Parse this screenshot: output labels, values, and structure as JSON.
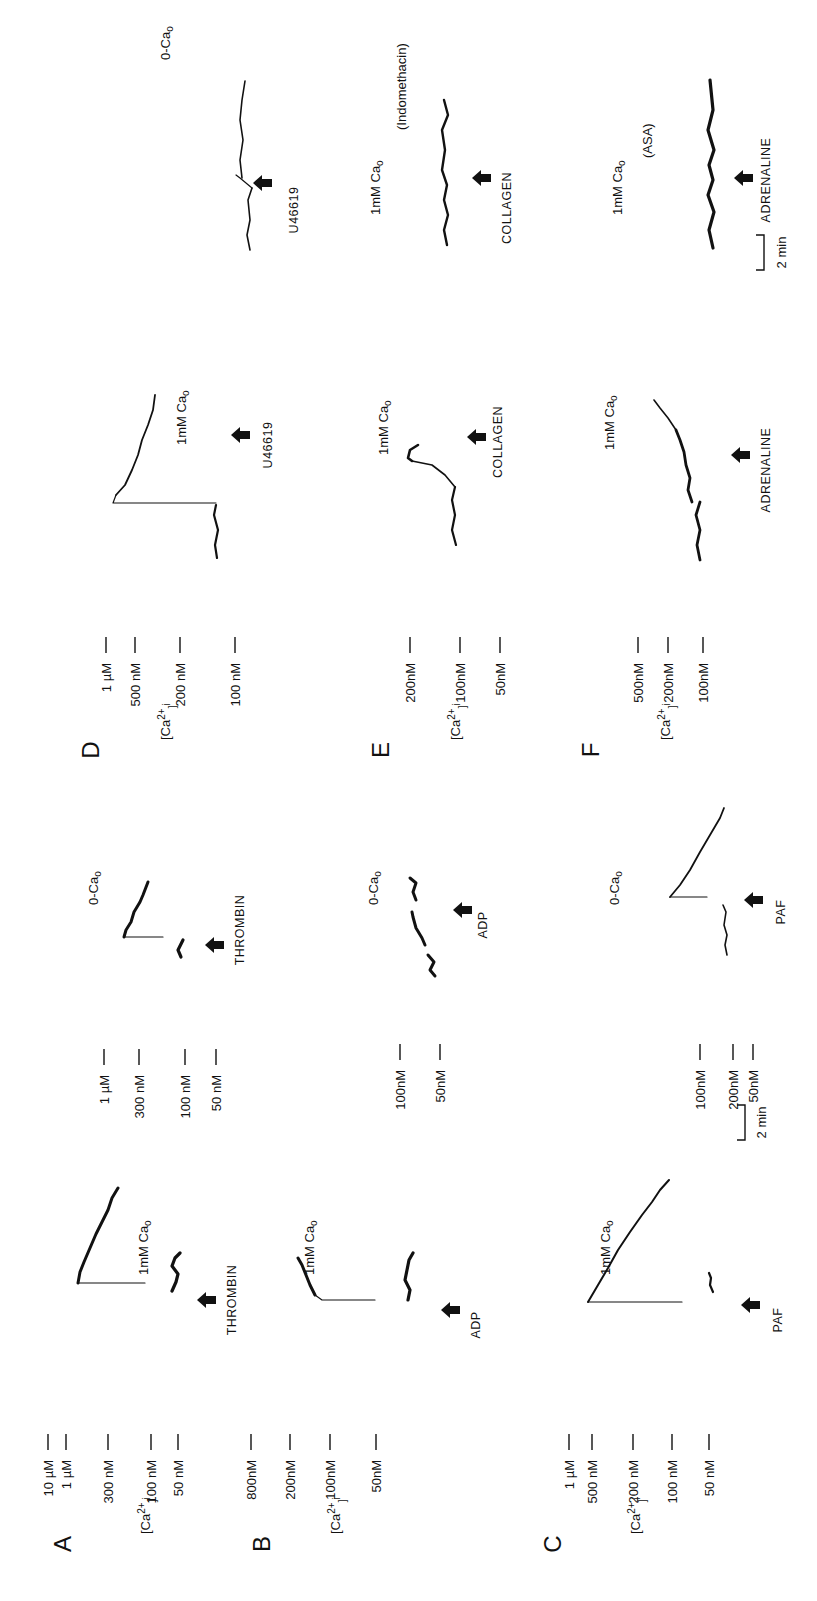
{
  "figure": {
    "rotation_deg": -90,
    "ylabel": "[Ca2+]i",
    "time_scale_bar": "2 min",
    "arrow_icon": "up-arrow-icon"
  },
  "chart_data": [
    {
      "type": "line",
      "panel": "A",
      "title": "A",
      "condition": "1mM Cao",
      "agonist": "THROMBIN",
      "ylabel": "[Ca2+]i",
      "ticks": [
        "10 µM",
        "1 µM",
        "300 nM",
        "100 nM",
        "50 nM"
      ],
      "description": "Baseline ~80 nM; on THROMBIN, rapid rise to ~1 µM then gradual decline toward ~300 nM",
      "series": [
        {
          "name": "[Ca2+]i",
          "x_min": [
            0,
            1,
            1.05,
            2,
            3,
            4
          ],
          "values_nM": [
            80,
            80,
            1000,
            700,
            500,
            350
          ]
        }
      ]
    },
    {
      "type": "line",
      "panel": "A",
      "title": "A (0-Cao)",
      "condition": "0-Cao",
      "agonist": "THROMBIN",
      "ticks": [
        "1 µM",
        "300 nM",
        "100 nM",
        "50 nM"
      ],
      "description": "Baseline ~80 nM; on THROMBIN, rise to ~300 nM then slow decline",
      "series": [
        {
          "name": "[Ca2+]i",
          "x_min": [
            0,
            1,
            1.05,
            2,
            3,
            3.5
          ],
          "values_nM": [
            80,
            80,
            320,
            260,
            200,
            170
          ]
        }
      ]
    },
    {
      "type": "line",
      "panel": "B",
      "title": "B",
      "condition": "1mM Cao",
      "agonist": "ADP",
      "ticks": [
        "800nM",
        "200nM",
        "100nM",
        "50nM"
      ],
      "description": "Baseline ~70 nM; on ADP, rise to ~800 nM then decline",
      "series": [
        {
          "name": "[Ca2+]i",
          "x_min": [
            0,
            1,
            1.05,
            1.6,
            2.3
          ],
          "values_nM": [
            70,
            70,
            750,
            450,
            300
          ]
        }
      ]
    },
    {
      "type": "line",
      "panel": "B",
      "title": "B (0-Cao)",
      "condition": "0-Cao",
      "agonist": "ADP",
      "ticks": [
        "100nM",
        "50nM"
      ],
      "description": "Baseline ~60 nM; small transient after ADP (~100 nM)",
      "series": [
        {
          "name": "[Ca2+]i",
          "x_min": [
            0,
            1,
            1.1,
            1.8,
            2.4
          ],
          "values_nM": [
            55,
            60,
            65,
            90,
            95
          ]
        }
      ]
    },
    {
      "type": "line",
      "panel": "C",
      "title": "C",
      "condition": "1mM Cao",
      "agonist": "PAF",
      "ticks": [
        "1 µM",
        "500 nM",
        "200 nM",
        "100 nM",
        "50 nM"
      ],
      "description": "Baseline ~55 nM; on PAF, rise to ~1 µM then exponential-like decline",
      "series": [
        {
          "name": "[Ca2+]i",
          "x_min": [
            0,
            0.5,
            0.55,
            1.5,
            2.5,
            3.5
          ],
          "values_nM": [
            55,
            55,
            1000,
            450,
            250,
            170
          ]
        }
      ]
    },
    {
      "type": "line",
      "panel": "C",
      "title": "C (0-Cao)",
      "condition": "0-Cao",
      "agonist": "PAF",
      "ticks": [
        "200nM",
        "100nM",
        "50nM"
      ],
      "description": "Baseline ~50 nM; on PAF, rise to ~200 nM then decline to ~60 nM",
      "series": [
        {
          "name": "[Ca2+]i",
          "x_min": [
            0,
            1.2,
            1.25,
            2.2,
            3.2
          ],
          "values_nM": [
            50,
            50,
            200,
            110,
            60
          ]
        }
      ]
    },
    {
      "type": "line",
      "panel": "D",
      "title": "D",
      "condition": "1mM Cao",
      "agonist": "U46619",
      "ticks": [
        "1 µM",
        "500 nM",
        "200 nM",
        "100 nM"
      ],
      "description": "Baseline ~100 nM; on U46619, rise to ~1 µM then decline toward ~400 nM",
      "series": [
        {
          "name": "[Ca2+]i",
          "x_min": [
            0,
            1,
            1.05,
            2,
            3.5
          ],
          "values_nM": [
            100,
            100,
            950,
            650,
            450
          ]
        }
      ]
    },
    {
      "type": "line",
      "panel": "D",
      "title": "D (0-Cao)",
      "condition": "0-Cao",
      "agonist": "U46619",
      "ticks": [],
      "description": "Small step increase after U46619",
      "series": [
        {
          "name": "[Ca2+]i",
          "x_min": [
            0,
            1.2,
            1.3,
            3.2
          ],
          "values_nM": [
            100,
            100,
            140,
            130
          ]
        }
      ]
    },
    {
      "type": "line",
      "panel": "E",
      "title": "E",
      "condition": "1mM Cao",
      "agonist": "COLLAGEN",
      "ticks": [
        "200nM",
        "100nM",
        "50nM"
      ],
      "description": "Baseline ~100 nM; delayed rise after COLLAGEN to ~200 nM",
      "series": [
        {
          "name": "[Ca2+]i",
          "x_min": [
            0,
            1,
            1.5,
            2.0,
            2.4
          ],
          "values_nM": [
            100,
            100,
            130,
            210,
            180
          ]
        }
      ]
    },
    {
      "type": "line",
      "panel": "E",
      "title": "E (Indomethacin)",
      "condition": "1mM Cao (Indomethacin)",
      "agonist": "COLLAGEN",
      "ticks": [],
      "description": "No response to COLLAGEN in presence of indomethacin",
      "series": [
        {
          "name": "[Ca2+]i",
          "x_min": [
            0,
            1.5,
            3
          ],
          "values_nM": [
            100,
            100,
            105
          ]
        }
      ]
    },
    {
      "type": "line",
      "panel": "F",
      "title": "F",
      "condition": "1mM Cao",
      "agonist": "ADRENALINE",
      "ticks": [
        "500nM",
        "200nM",
        "100nM"
      ],
      "description": "Baseline ~100 nM; gradual rise after ADRENALINE",
      "series": [
        {
          "name": "[Ca2+]i",
          "x_min": [
            0,
            1.2,
            2,
            3
          ],
          "values_nM": [
            100,
            105,
            150,
            250
          ]
        }
      ]
    },
    {
      "type": "line",
      "panel": "F",
      "title": "F (ASA)",
      "condition": "1mM Cao (ASA)",
      "agonist": "ADRENALINE",
      "ticks": [],
      "description": "Small increase after ADRENALINE in presence of ASA",
      "series": [
        {
          "name": "[Ca2+]i",
          "x_min": [
            0,
            1.3,
            3.2
          ],
          "values_nM": [
            100,
            110,
            130
          ]
        }
      ]
    }
  ],
  "render": {
    "panels": [
      {
        "letter": "A",
        "letter_pos": [
          62,
          1544
        ],
        "ylabel_pos": [
          145,
          1506
        ],
        "ticks": [
          {
            "t": "10 µM",
            "x": 48,
            "y1": 1460
          },
          {
            "t": "1 µM",
            "x": 66,
            "y1": 1460
          },
          {
            "t": "300 nM",
            "x": 108,
            "y1": 1460
          },
          {
            "t": "100 nM",
            "x": 151,
            "y1": 1460
          },
          {
            "t": "50 nM",
            "x": 178,
            "y1": 1460
          }
        ],
        "tick_x_end": 1400
      },
      {
        "letter": "B",
        "letter_pos": [
          261,
          1544
        ],
        "ylabel_pos": [
          335,
          1506
        ],
        "ticks": [
          {
            "t": "800nM",
            "x": 251,
            "y1": 1460
          },
          {
            "t": "200nM",
            "x": 290,
            "y1": 1460
          },
          {
            "t": "100nM",
            "x": 330,
            "y1": 1460
          },
          {
            "t": "50nM",
            "x": 376,
            "y1": 1460
          }
        ],
        "tick_x_end": 1400
      },
      {
        "letter": "C",
        "letter_pos": [
          552,
          1544
        ],
        "ylabel_pos": [
          635,
          1506
        ],
        "ticks": [
          {
            "t": "1 µM",
            "x": 569,
            "y1": 1460
          },
          {
            "t": "500 nM",
            "x": 592,
            "y1": 1460
          },
          {
            "t": "200 nM",
            "x": 633,
            "y1": 1460
          },
          {
            "t": "100 nM",
            "x": 672,
            "y1": 1460
          },
          {
            "t": "50 nM",
            "x": 709,
            "y1": 1460
          }
        ],
        "tick_x_end": 1400
      },
      {
        "letter": "D",
        "letter_pos": [
          90,
          750
        ],
        "ylabel_pos": [
          165,
          712
        ],
        "ticks": [
          {
            "t": "1 µM",
            "x": 106,
            "y1": 663
          },
          {
            "t": "500 nM",
            "x": 135,
            "y1": 663
          },
          {
            "t": "200 nM",
            "x": 180,
            "y1": 663
          },
          {
            "t": "100 nM",
            "x": 235,
            "y1": 663
          }
        ],
        "tick_x_end": 605
      },
      {
        "letter": "E",
        "letter_pos": [
          380,
          750
        ],
        "ylabel_pos": [
          455,
          712
        ],
        "ticks": [
          {
            "t": "200nM",
            "x": 410,
            "y1": 663
          },
          {
            "t": "100nM",
            "x": 460,
            "y1": 663
          },
          {
            "t": "50nM",
            "x": 500,
            "y1": 663
          }
        ],
        "tick_x_end": 605
      },
      {
        "letter": "F",
        "letter_pos": [
          590,
          750
        ],
        "ylabel_pos": [
          665,
          712
        ],
        "ticks": [
          {
            "t": "500nM",
            "x": 638,
            "y1": 663
          },
          {
            "t": "200nM",
            "x": 668,
            "y1": 663
          },
          {
            "t": "100nM",
            "x": 703,
            "y1": 663
          }
        ],
        "tick_x_end": 605
      }
    ],
    "subpanels": [
      {
        "ticks": [
          {
            "t": "1 µM",
            "x": 104,
            "y1": 1075
          },
          {
            "t": "300 nM",
            "x": 139,
            "y1": 1075
          },
          {
            "t": "100 nM",
            "x": 185,
            "y1": 1075
          },
          {
            "t": "50 nM",
            "x": 216,
            "y1": 1075
          }
        ],
        "tick_x_end": 1000
      },
      {
        "ticks": [
          {
            "t": "100nM",
            "x": 400,
            "y1": 1070
          },
          {
            "t": "50nM",
            "x": 440,
            "y1": 1070
          }
        ],
        "tick_x_end": 1000
      },
      {
        "ticks": [
          {
            "t": "200nM",
            "x": 733,
            "y1": 1070
          },
          {
            "t": "100nM",
            "x": 700,
            "y1": 1070
          },
          {
            "t": "50nM",
            "x": 753,
            "y1": 1070
          }
        ],
        "tick_x_end": 1000
      }
    ],
    "conditions": [
      {
        "t": "1mM Cao",
        "x": 148,
        "y": 1275
      },
      {
        "t": "0-Cao",
        "x": 98,
        "y": 905
      },
      {
        "t": "1mM Cao",
        "x": 314,
        "y": 1275
      },
      {
        "t": "0-Cao",
        "x": 378,
        "y": 905
      },
      {
        "t": "1mM Cao",
        "x": 610,
        "y": 1275
      },
      {
        "t": "0-Cao",
        "x": 619,
        "y": 905
      },
      {
        "t": "1mM Cao",
        "x": 186,
        "y": 445
      },
      {
        "t": "0-Cao",
        "x": 170,
        "y": 60
      },
      {
        "t": "1mM Cao",
        "x": 388,
        "y": 455
      },
      {
        "t": "1mM Cao",
        "x": 380,
        "y": 215
      },
      {
        "t": "(Indomethacin)",
        "x": 406,
        "y": 130
      },
      {
        "t": "1mM Cao",
        "x": 614,
        "y": 450
      },
      {
        "t": "1mM Cao",
        "x": 622,
        "y": 215
      },
      {
        "t": "(ASA)",
        "x": 652,
        "y": 158
      }
    ],
    "agonists": [
      {
        "t": "THROMBIN",
        "x": 236,
        "y": 1300,
        "ax": 206,
        "ay": 1300
      },
      {
        "t": "THROMBIN",
        "x": 244,
        "y": 930,
        "ax": 214,
        "ay": 945
      },
      {
        "t": "ADP",
        "x": 480,
        "y": 1325,
        "ax": 450,
        "ay": 1310
      },
      {
        "t": "ADP",
        "x": 487,
        "y": 925,
        "ax": 462,
        "ay": 910
      },
      {
        "t": "PAF",
        "x": 782,
        "y": 1320,
        "ax": 750,
        "ay": 1305
      },
      {
        "t": "PAF",
        "x": 785,
        "y": 912,
        "ax": 753,
        "ay": 900
      },
      {
        "t": "U46619",
        "x": 272,
        "y": 445,
        "ax": 240,
        "ay": 435
      },
      {
        "t": "U46619",
        "x": 298,
        "y": 210,
        "ax": 262,
        "ay": 183
      },
      {
        "t": "COLLAGEN",
        "x": 502,
        "y": 442,
        "ax": 476,
        "ay": 437
      },
      {
        "t": "COLLAGEN",
        "x": 511,
        "y": 208,
        "ax": 481,
        "ay": 178
      },
      {
        "t": "ADRENALINE",
        "x": 770,
        "y": 470,
        "ax": 740,
        "ay": 455
      },
      {
        "t": "ADRENALINE",
        "x": 770,
        "y": 180,
        "ax": 743,
        "ay": 178
      }
    ],
    "scale_bars": [
      {
        "t": "2 min",
        "x": 758,
        "y": 1120,
        "bx": 745,
        "by1": 1105,
        "by2": 1140
      },
      {
        "t": "2 min",
        "x": 778,
        "y": 250,
        "bx": 764,
        "by1": 235,
        "by2": 270
      }
    ],
    "traces": [
      {
        "w": 3.2,
        "pts": "180,1253 175,1258 172,1266 178,1274 176,1282 172,1291"
      },
      {
        "w": 1.2,
        "pts": "145,1283 78,1283"
      },
      {
        "w": 3.0,
        "pts": "78,1283 80,1272 84,1262 90,1248 96,1234 102,1222 108,1210 112,1198 118,1188"
      },
      {
        "w": 3.2,
        "pts": "413,1253 409,1260 407,1270 405,1280 410,1290 408,1300"
      },
      {
        "w": 1.2,
        "pts": "375,1300 322,1300 315,1295"
      },
      {
        "w": 3.0,
        "pts": "315,1295 310,1285 306,1275 302,1265 298,1258"
      },
      {
        "w": 2.2,
        "pts": "713,1292 710,1285 711,1278 709,1273"
      },
      {
        "w": 1.2,
        "pts": "682,1302 588,1302"
      },
      {
        "w": 2.0,
        "pts": "588,1302 598,1285 608,1268 618,1250 630,1232 642,1215 652,1202 660,1190 669,1180"
      },
      {
        "w": 3.2,
        "pts": "181,957 178,950 183,940"
      },
      {
        "w": 1.2,
        "pts": "163,937 124,937"
      },
      {
        "w": 3.0,
        "pts": "124,937 126,930 131,922 134,912 140,902 143,895 148,882"
      },
      {
        "w": 3.0,
        "pts": "435,976 430,970 434,962 428,955"
      },
      {
        "w": 3.0,
        "pts": "425,945 422,938 416,928 413,917 412,912"
      },
      {
        "w": 3.0,
        "pts": "416,900 413,892 416,883 410,878"
      },
      {
        "w": 1.6,
        "pts": "727,955 725,945 727,935 724,925 726,912 723,905"
      },
      {
        "w": 1.2,
        "pts": "707,897 670,897"
      },
      {
        "w": 1.8,
        "pts": "670,897 680,885 690,870 700,852 710,835 720,818 724,808"
      },
      {
        "w": 2.2,
        "pts": "217,558 215,545 218,530 214,515 216,505"
      },
      {
        "w": 1.2,
        "pts": "216,503 113,503 116,495"
      },
      {
        "w": 1.8,
        "pts": "116,495 125,485 132,470 138,455 142,440 148,425 153,410 155,395"
      },
      {
        "w": 2.2,
        "pts": "456,545 452,530 455,515 452,500 455,487"
      },
      {
        "w": 1.6,
        "pts": "455,487 445,475 432,465 412,461"
      },
      {
        "w": 2.6,
        "pts": "412,461 408,458 410,450 418,445"
      },
      {
        "w": 2.8,
        "pts": "700,560 697,545 700,530 696,515 700,502"
      },
      {
        "w": 2.8,
        "pts": "692,502 688,490 690,478 686,465 684,452 680,440 676,430"
      },
      {
        "w": 1.6,
        "pts": "676,430 668,418 660,408 654,400"
      },
      {
        "w": 1.6,
        "pts": "250,250 247,235 250,220 248,200 252,188"
      },
      {
        "w": 1.2,
        "pts": "252,188 240,178 236,175"
      },
      {
        "w": 1.6,
        "pts": "242,178 240,160 243,140 240,120 242,100 245,81"
      },
      {
        "w": 2.4,
        "pts": "447,245 444,230 448,215 444,200 447,185 442,170 445,150 442,130 448,115 444,100"
      },
      {
        "w": 3.2,
        "pts": "713,248 709,230 714,212 708,195 713,180 709,165 714,150 708,130 713,110 710,80"
      }
    ]
  }
}
